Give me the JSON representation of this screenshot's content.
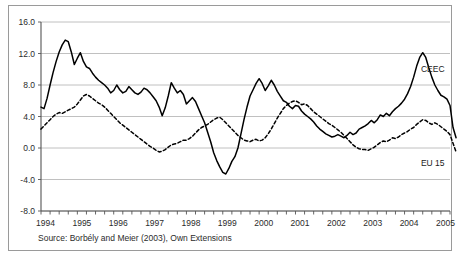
{
  "figure": {
    "source_note": "Source: Borbély and Meier (2003), Own Extensions",
    "frame_color": "#9a9a9a",
    "grid_color": "#b0b0b0",
    "axis_color": "#555555",
    "series_color": "#000000"
  },
  "chart_data": {
    "type": "line",
    "title": "",
    "xlabel": "",
    "ylabel": "",
    "ylim": [
      -8.0,
      16.0
    ],
    "xlim": [
      1994.0,
      2005.25
    ],
    "ytick_labels": [
      "16.0",
      "12.0",
      "8.0",
      "4.0",
      "0.0",
      "-4.0",
      "-8.0"
    ],
    "ytick_values": [
      16.0,
      12.0,
      8.0,
      4.0,
      0.0,
      -4.0,
      -8.0
    ],
    "xtick_labels": [
      "1994",
      "1995",
      "1996",
      "1997",
      "1998",
      "1999",
      "2000",
      "2001",
      "2002",
      "2003",
      "2004",
      "2005"
    ],
    "xtick_values": [
      1994,
      1995,
      1996,
      1997,
      1998,
      1999,
      2000,
      2001,
      2002,
      2003,
      2004,
      2005
    ],
    "minor_ticks_per_year": 4,
    "grid": "horizontal",
    "legend_position": "inline-right",
    "series": [
      {
        "name": "CEEC",
        "style": "solid",
        "label_x": 2004.45,
        "label_y": 9.6,
        "x_start": 1994.0,
        "x_step": 0.0833333,
        "values": [
          5.2,
          5.0,
          6.3,
          8.0,
          9.6,
          11.0,
          12.2,
          13.1,
          13.7,
          13.5,
          12.2,
          10.6,
          11.4,
          12.1,
          11.0,
          10.3,
          10.1,
          9.5,
          9.0,
          8.6,
          8.3,
          8.0,
          7.6,
          7.0,
          7.3,
          8.0,
          7.4,
          7.0,
          7.2,
          7.8,
          7.4,
          7.0,
          6.8,
          7.1,
          7.6,
          7.4,
          7.0,
          6.5,
          6.0,
          5.2,
          4.1,
          5.1,
          6.6,
          8.3,
          7.6,
          7.0,
          7.3,
          6.8,
          5.6,
          6.0,
          6.4,
          5.9,
          5.0,
          4.1,
          3.2,
          2.0,
          0.8,
          -0.6,
          -1.6,
          -2.4,
          -3.1,
          -3.3,
          -2.6,
          -1.7,
          -1.1,
          0.0,
          1.8,
          3.6,
          5.2,
          6.6,
          7.4,
          8.2,
          8.8,
          8.2,
          7.3,
          7.9,
          8.6,
          8.0,
          7.2,
          6.6,
          6.0,
          5.8,
          5.3,
          5.0,
          5.4,
          5.3,
          4.7,
          4.3,
          4.0,
          3.7,
          3.3,
          2.8,
          2.4,
          2.1,
          1.8,
          1.6,
          1.4,
          1.5,
          1.7,
          1.5,
          1.3,
          1.6,
          2.0,
          1.7,
          1.9,
          2.4,
          2.6,
          2.8,
          3.1,
          3.5,
          3.2,
          3.6,
          4.2,
          4.0,
          4.4,
          4.1,
          4.6,
          5.0,
          5.3,
          5.7,
          6.2,
          6.9,
          7.8,
          9.0,
          10.4,
          11.5,
          12.1,
          11.5,
          10.2,
          9.0,
          8.0,
          7.3,
          6.7,
          6.5,
          6.2,
          5.4,
          2.6,
          1.3
        ]
      },
      {
        "name": "EU 15",
        "style": "dashed",
        "label_x": 2004.45,
        "label_y": -2.3,
        "x_start": 1994.0,
        "x_step": 0.0833333,
        "values": [
          2.4,
          2.8,
          3.2,
          3.6,
          4.0,
          4.3,
          4.5,
          4.4,
          4.6,
          4.8,
          5.0,
          5.2,
          5.6,
          6.1,
          6.6,
          6.8,
          6.6,
          6.3,
          6.0,
          5.7,
          5.5,
          5.2,
          4.8,
          4.4,
          4.0,
          3.6,
          3.2,
          2.9,
          2.6,
          2.3,
          2.0,
          1.7,
          1.4,
          1.1,
          0.8,
          0.5,
          0.2,
          0.0,
          -0.3,
          -0.5,
          -0.4,
          -0.2,
          0.1,
          0.4,
          0.5,
          0.6,
          0.8,
          1.0,
          1.0,
          1.2,
          1.5,
          1.9,
          2.3,
          2.6,
          2.8,
          3.0,
          3.3,
          3.6,
          3.8,
          3.9,
          3.6,
          3.2,
          2.8,
          2.4,
          2.0,
          1.6,
          1.3,
          1.0,
          0.9,
          0.8,
          1.0,
          1.1,
          0.9,
          1.0,
          1.3,
          1.8,
          2.4,
          3.1,
          3.8,
          4.4,
          5.0,
          5.4,
          5.7,
          5.9,
          6.0,
          5.8,
          5.5,
          5.6,
          5.4,
          5.0,
          4.6,
          4.3,
          4.0,
          3.7,
          3.4,
          3.1,
          2.9,
          2.6,
          2.3,
          2.0,
          1.6,
          1.2,
          0.8,
          0.4,
          0.1,
          -0.1,
          -0.2,
          -0.2,
          -0.3,
          -0.1,
          0.1,
          0.4,
          0.7,
          0.9,
          0.8,
          1.0,
          1.3,
          1.2,
          1.4,
          1.7,
          1.9,
          2.1,
          2.4,
          2.6,
          3.0,
          3.3,
          3.6,
          3.5,
          3.2,
          3.0,
          3.2,
          3.0,
          2.7,
          2.4,
          2.1,
          1.7,
          0.6,
          -0.5
        ]
      }
    ]
  }
}
